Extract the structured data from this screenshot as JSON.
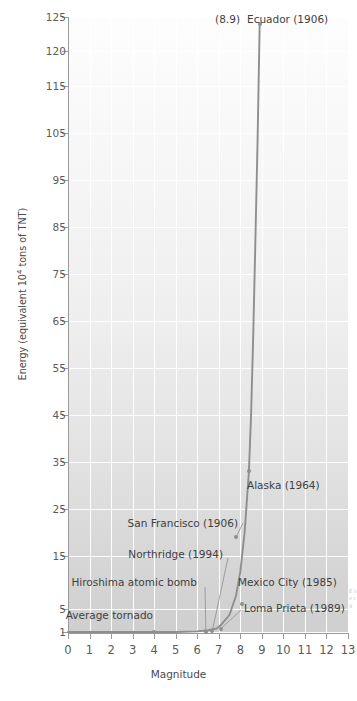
{
  "chart_data": {
    "type": "line",
    "title": "",
    "xlabel": "Magnitude",
    "ylabel": "Energy (equivalent 10⁴ tons of TNT)",
    "xlim": [
      0,
      13
    ],
    "ylim": [
      1,
      125
    ],
    "grid": true,
    "legend": "none",
    "x_ticks": [
      "0",
      "1",
      "2",
      "3",
      "4",
      "5",
      "6",
      "7",
      "8",
      "9",
      "10",
      "11",
      "12",
      "13"
    ],
    "y_ticks": [
      "1",
      "5",
      "15",
      "25",
      "35",
      "45",
      "55",
      "65",
      "75",
      "85",
      "95",
      "105",
      "115",
      "120",
      "125"
    ],
    "series": [
      {
        "name": "Energy vs Magnitude",
        "x": [
          0.0,
          4.0,
          5.0,
          6.0,
          6.5,
          6.9,
          7.1,
          7.5,
          7.8,
          8.0,
          8.2,
          8.4,
          8.5,
          8.6,
          8.7,
          8.8,
          8.9
        ],
        "y": [
          1.0,
          1.0,
          1.0,
          1.1,
          1.3,
          1.6,
          2.2,
          4.0,
          7.5,
          12.0,
          20.0,
          33.0,
          45.0,
          62.0,
          82.0,
          103.0,
          124.0
        ]
      }
    ],
    "points": [
      {
        "label": "Ecuador (1906)",
        "magnitude": 8.9,
        "energy": 124,
        "note": "(8.9)",
        "side": "right"
      },
      {
        "label": "Alaska (1964)",
        "magnitude": 8.4,
        "energy": 33,
        "note": "",
        "side": "right"
      },
      {
        "label": "Mexico City (1985)",
        "magnitude": 8.1,
        "energy": 6,
        "note": "",
        "side": "right"
      },
      {
        "label": "San Francisco (1906)",
        "magnitude": 7.8,
        "energy": 19,
        "note": "",
        "side": "left"
      },
      {
        "label": "Loma Prieta (1989)",
        "magnitude": 7.1,
        "energy": 1.6,
        "note": "",
        "side": "right"
      },
      {
        "label": "Northridge (1994)",
        "magnitude": 6.7,
        "energy": 1.2,
        "note": "",
        "side": "left"
      },
      {
        "label": "Hiroshima atomic bomb",
        "magnitude": 6.4,
        "energy": 1.05,
        "note": "",
        "side": "left"
      },
      {
        "label": "Average tornado",
        "magnitude": 4.0,
        "energy": 1.0,
        "note": "",
        "side": "left"
      }
    ],
    "colors": {
      "curve": "#8e8e8e",
      "point": "#8e8e8e",
      "grid": "#ffffff",
      "axis": "#9a9a9a",
      "text": "#3f3f3f",
      "plot_bg_top": "#fdfdfd",
      "plot_bg_bottom": "#cfcfcf"
    }
  },
  "axis_titles": {
    "x": "Magnitude",
    "y_prefix": "Energy (equivalent 10",
    "y_exponent": "4",
    "y_suffix": " tons of TNT)"
  },
  "annotations": {
    "ecuador": {
      "note": "(8.9)",
      "label": "Ecuador (1906)"
    },
    "alaska": {
      "label": "Alaska (1964)"
    },
    "san_francisco": {
      "label": "San Francisco (1906)"
    },
    "northridge": {
      "label": "Northridge (1994)"
    },
    "mexico_city": {
      "label": "Mexico City (1985)"
    },
    "hiroshima": {
      "label": "Hiroshima atomic bomb"
    },
    "loma_prieta": {
      "label": "Loma Prieta (1989)"
    },
    "average_tornado": {
      "label": "Average tornado"
    }
  },
  "edge_caption": "E n e r g"
}
